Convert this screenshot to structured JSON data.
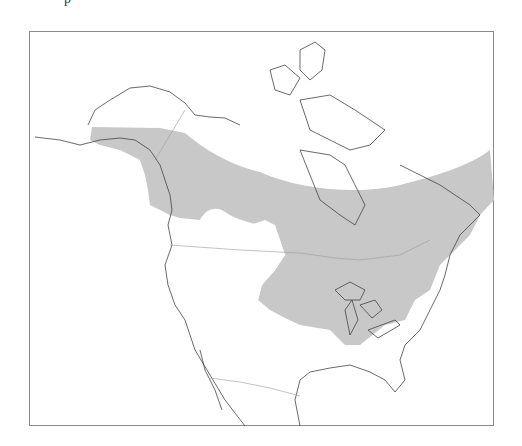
{
  "top_glyph": "p",
  "map": {
    "region": "North America",
    "type": "species range map",
    "range_fill_color": "#c8c8c8",
    "coastline_color": "#444444",
    "border_color": "#9a9a9a",
    "frame_color": "#8a8a8a",
    "background_color": "#ffffff"
  }
}
